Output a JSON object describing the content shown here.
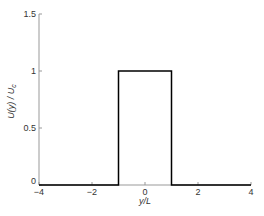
{
  "chart_data": {
    "type": "line",
    "title": "",
    "xlabel": "y/L",
    "ylabel": "U(y) / U_c",
    "ylabel_parts": {
      "main": "U(y) / U",
      "sub": "c"
    },
    "xlim": [
      -4,
      4
    ],
    "ylim": [
      0,
      1.5
    ],
    "xticks": [
      -4,
      -2,
      0,
      2,
      4
    ],
    "xtick_labels": [
      "-4",
      "-2",
      "0",
      "2",
      "4"
    ],
    "yticks": [
      0,
      0.5,
      1,
      1.5
    ],
    "ytick_labels": [
      "0",
      "0.5",
      "1",
      "1.5"
    ],
    "grid": false,
    "legend": null,
    "series": [
      {
        "name": "top-hat profile",
        "color": "#000000",
        "x": [
          -4,
          -1,
          -1,
          1,
          1,
          4
        ],
        "y": [
          0,
          0,
          1,
          1,
          0,
          0
        ]
      }
    ]
  },
  "style": {
    "axis_color": "#999999",
    "line_color": "#000000",
    "text_color": "#333333"
  }
}
